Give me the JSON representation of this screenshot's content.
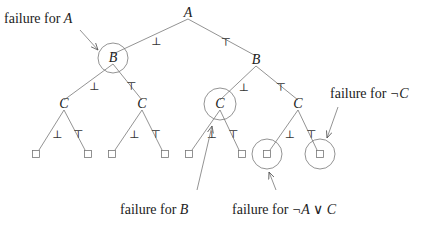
{
  "diagram": {
    "type": "binary-decision-tree",
    "nodes": [
      {
        "id": "A",
        "label": "A",
        "kind": "var",
        "circled": false
      },
      {
        "id": "B1",
        "label": "B",
        "kind": "var",
        "circled": true,
        "parent": "A",
        "edge": "⊥"
      },
      {
        "id": "B2",
        "label": "B",
        "kind": "var",
        "circled": false,
        "parent": "A",
        "edge": "⊤"
      },
      {
        "id": "C1",
        "label": "C",
        "kind": "var",
        "circled": false,
        "parent": "B1",
        "edge": "⊥"
      },
      {
        "id": "C2",
        "label": "C",
        "kind": "var",
        "circled": false,
        "parent": "B1",
        "edge": "⊤"
      },
      {
        "id": "C3",
        "label": "C",
        "kind": "var",
        "circled": true,
        "parent": "B2",
        "edge": "⊥"
      },
      {
        "id": "C4",
        "label": "C",
        "kind": "var",
        "circled": false,
        "parent": "B2",
        "edge": "⊤"
      },
      {
        "id": "L1",
        "label": "□",
        "kind": "leaf",
        "circled": false,
        "parent": "C1",
        "edge": "⊥"
      },
      {
        "id": "L2",
        "label": "□",
        "kind": "leaf",
        "circled": false,
        "parent": "C1",
        "edge": "⊤"
      },
      {
        "id": "L3",
        "label": "□",
        "kind": "leaf",
        "circled": false,
        "parent": "C2",
        "edge": "⊥"
      },
      {
        "id": "L4",
        "label": "□",
        "kind": "leaf",
        "circled": false,
        "parent": "C2",
        "edge": "⊤"
      },
      {
        "id": "L5",
        "label": "□",
        "kind": "leaf",
        "circled": false,
        "parent": "C3",
        "edge": "⊥"
      },
      {
        "id": "L6",
        "label": "□",
        "kind": "leaf",
        "circled": false,
        "parent": "C3",
        "edge": "⊤"
      },
      {
        "id": "L7",
        "label": "□",
        "kind": "leaf",
        "circled": true,
        "parent": "C4",
        "edge": "⊥"
      },
      {
        "id": "L8",
        "label": "□",
        "kind": "leaf",
        "circled": true,
        "parent": "C4",
        "edge": "⊤"
      }
    ],
    "annotations": [
      {
        "id": "failA",
        "prefix": "failure for ",
        "formula": "A",
        "target": "B1"
      },
      {
        "id": "failB",
        "prefix": "failure for ",
        "formula": "B",
        "target": "C3"
      },
      {
        "id": "failNotAorC",
        "prefix": "failure for ",
        "formula": "¬A ∨ C",
        "target": "L7"
      },
      {
        "id": "failNotC",
        "prefix": "failure for ",
        "formula": "¬C",
        "target": "L8"
      }
    ]
  }
}
